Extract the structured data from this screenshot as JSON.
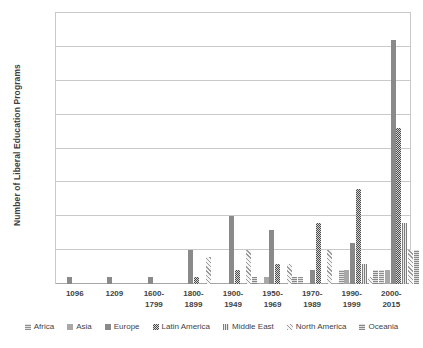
{
  "chart_data": {
    "type": "bar",
    "title": "",
    "xlabel": "",
    "ylabel": "Number of Liberal Education Programs",
    "ylim": [
      0,
      40
    ],
    "yticks": [
      0,
      5,
      10,
      15,
      20,
      25,
      30,
      35,
      40
    ],
    "grid": true,
    "legend_position": "bottom",
    "categories": [
      "1096",
      "1209",
      "1600-\n1799",
      "1800-\n1899",
      "1900-\n1949",
      "1950-\n1969",
      "1970-\n1989",
      "1990-\n1999",
      "2000-\n2015"
    ],
    "category_lines": [
      [
        "1096",
        ""
      ],
      [
        "1209",
        ""
      ],
      [
        "1600-",
        "1799"
      ],
      [
        "1800-",
        "1899"
      ],
      [
        "1900-",
        "1949"
      ],
      [
        "1950-",
        "1969"
      ],
      [
        "1970-",
        "1989"
      ],
      [
        "1990-",
        "1999"
      ],
      [
        "2000-",
        "2015"
      ]
    ],
    "series": [
      {
        "name": "Africa",
        "swatch": "hatch-horizontal-light",
        "values": [
          0,
          0,
          0,
          0,
          0,
          0,
          1,
          2,
          2
        ]
      },
      {
        "name": "Asia",
        "swatch": "solid-light-gray",
        "values": [
          0,
          0,
          0,
          0,
          0,
          1,
          0,
          2,
          2
        ]
      },
      {
        "name": "Europe",
        "swatch": "solid-mid-gray",
        "values": [
          1,
          1,
          1,
          5,
          10,
          8,
          2,
          6,
          36
        ]
      },
      {
        "name": "Latin America",
        "swatch": "solid-dark",
        "values": [
          0,
          0,
          0,
          1,
          2,
          3,
          9,
          14,
          23
        ]
      },
      {
        "name": "Middle East",
        "swatch": "hatch-vertical",
        "values": [
          0,
          0,
          0,
          0,
          0,
          0,
          0,
          3,
          9
        ]
      },
      {
        "name": "North America",
        "swatch": "hatch-diagonal",
        "values": [
          0,
          0,
          0,
          4,
          5,
          3,
          5,
          1,
          5
        ]
      },
      {
        "name": "Oceania",
        "swatch": "hatch-horizontal",
        "values": [
          0,
          0,
          0,
          0,
          1,
          1,
          0,
          2,
          5
        ]
      }
    ]
  }
}
